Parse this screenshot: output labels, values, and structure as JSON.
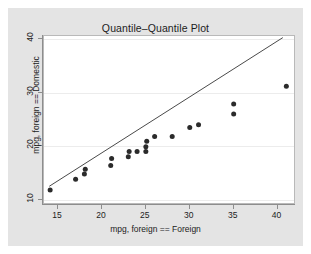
{
  "figure": {
    "background_color": "#e4e4e4",
    "plot_background_color": "#ffffff",
    "axis_color": "#8d8d8d",
    "grid_color": "#ececec",
    "marker_color": "#2b2b2b",
    "line_color": "#4a4a4a"
  },
  "chart_data": {
    "type": "scatter",
    "title": "Quantile–Quantile Plot",
    "xlabel": "mpg, foreign == Foreign",
    "ylabel": "mpg, foreign == Domestic",
    "xlim": [
      13.4,
      42.1
    ],
    "ylim": [
      9.0,
      40.6
    ],
    "xticks": [
      15,
      20,
      25,
      30,
      35,
      40
    ],
    "yticks": [
      10,
      20,
      30,
      40
    ],
    "grid": true,
    "grid_axis": "y",
    "legend": null,
    "points": [
      {
        "x": 14.1,
        "y": 11.8
      },
      {
        "x": 17.0,
        "y": 13.8
      },
      {
        "x": 18.0,
        "y": 14.8
      },
      {
        "x": 18.1,
        "y": 15.7
      },
      {
        "x": 21.0,
        "y": 16.4
      },
      {
        "x": 21.1,
        "y": 17.7
      },
      {
        "x": 23.0,
        "y": 18.0
      },
      {
        "x": 23.1,
        "y": 19.0
      },
      {
        "x": 24.0,
        "y": 19.0
      },
      {
        "x": 25.0,
        "y": 19.0
      },
      {
        "x": 25.0,
        "y": 19.9
      },
      {
        "x": 25.1,
        "y": 20.9
      },
      {
        "x": 26.0,
        "y": 21.8
      },
      {
        "x": 28.0,
        "y": 21.8
      },
      {
        "x": 30.0,
        "y": 23.5
      },
      {
        "x": 31.0,
        "y": 24.0
      },
      {
        "x": 35.0,
        "y": 26.0
      },
      {
        "x": 35.0,
        "y": 27.9
      },
      {
        "x": 41.0,
        "y": 31.2
      }
    ],
    "reference_line": {
      "kind": "identity",
      "x1": 14.0,
      "y1": 12.5,
      "x2": 40.6,
      "y2": 40.3
    }
  }
}
